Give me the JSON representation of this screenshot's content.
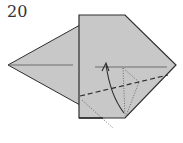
{
  "diagram": {
    "step_number": "20",
    "colors": {
      "paper": "#c8c8c8",
      "outline": "#2e2e2e",
      "crease": "#555555",
      "background": "#ffffff"
    },
    "symbols": [
      "valley-fold-line",
      "fold-arrow",
      "hidden-edge-dotted-lines",
      "existing-crease-lines"
    ]
  }
}
